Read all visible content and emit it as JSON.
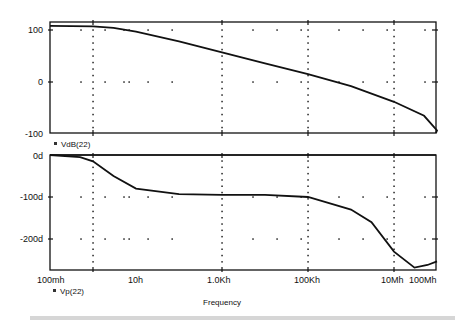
{
  "chart_data": [
    {
      "type": "line",
      "title": "",
      "xlabel": "",
      "ylabel": "",
      "x_scale": "log",
      "x_tick_labels": [
        "100mh",
        "10h",
        "1.0Kh",
        "100Kh",
        "10Mh",
        "100Mh"
      ],
      "y_tick_labels": [
        "100",
        "0",
        "-100"
      ],
      "ylim": [
        -100,
        115
      ],
      "grid": "dotted",
      "legend": [
        "VdB(22)"
      ],
      "series": [
        {
          "name": "VdB(22)",
          "x": [
            0.1,
            1,
            3,
            10,
            100,
            1000,
            10000,
            100000,
            1000000,
            10000000,
            50000000,
            100000000
          ],
          "values": [
            108,
            107,
            104,
            97,
            78,
            57,
            36,
            15,
            -8,
            -38,
            -65,
            -93
          ]
        }
      ]
    },
    {
      "type": "line",
      "title": "",
      "xlabel": "Frequency",
      "ylabel": "",
      "x_scale": "log",
      "x_tick_labels": [
        "100mh",
        "10h",
        "1.0Kh",
        "100Kh",
        "10Mh",
        "100Mh"
      ],
      "y_tick_labels": [
        "0d",
        "-100d",
        "-200d"
      ],
      "ylim": [
        -270,
        0
      ],
      "grid": "dotted",
      "legend": [
        "Vp(22)"
      ],
      "series": [
        {
          "name": "Vp(22)",
          "x": [
            0.1,
            0.5,
            1,
            3,
            10,
            100,
            1000,
            10000,
            100000,
            1000000,
            3000000,
            10000000,
            30000000,
            60000000,
            100000000
          ],
          "values": [
            0,
            -5,
            -15,
            -50,
            -80,
            -93,
            -95,
            -95,
            -100,
            -130,
            -160,
            -230,
            -268,
            -262,
            -253
          ]
        }
      ]
    }
  ],
  "top_plot": {
    "legend_label": "VdB(22)",
    "y_ticks": [
      "100",
      "0",
      "-100"
    ]
  },
  "bottom_plot": {
    "legend_label": "Vp(22)",
    "y_ticks": [
      "0d",
      "-100d",
      "-200d"
    ]
  },
  "x_axis": {
    "ticks": [
      "100mh",
      "10h",
      "1.0Kh",
      "100Kh",
      "10Mh",
      "100Mh"
    ],
    "label": "Frequency"
  }
}
